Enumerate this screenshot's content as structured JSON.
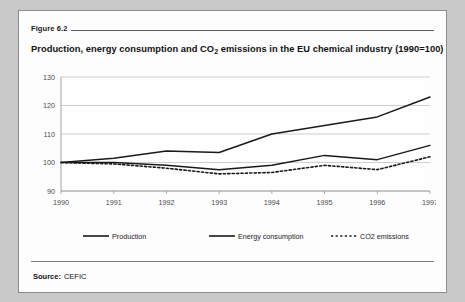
{
  "figure": {
    "label": "Figure 6.2",
    "title_part1": "Production, energy consumption and CO",
    "title_sub": "2",
    "title_part2": " emissions in the EU chemical industry (1990=100)",
    "title_full": "Production, energy consumption and CO2 emissions in the EU chemical industry (1990=100)"
  },
  "source": {
    "label": "Source:",
    "value": "CEFIC"
  },
  "legend": {
    "items": [
      {
        "name": "Production",
        "style": "solid",
        "color": "#1a1a1a"
      },
      {
        "name": "Energy consumption",
        "style": "solid",
        "color": "#1a1a1a"
      },
      {
        "name": "CO2 emissions",
        "style": "dotted",
        "color": "#1a1a1a"
      }
    ]
  },
  "chart_data": {
    "type": "line",
    "title": "Production, energy consumption and CO2 emissions in the EU chemical industry (1990=100)",
    "xlabel": "",
    "ylabel": "",
    "x": [
      "1990",
      "1991",
      "1992",
      "1993",
      "1994",
      "1995",
      "1996",
      "1997"
    ],
    "categories": [
      "1990",
      "1991",
      "1992",
      "1993",
      "1994",
      "1995",
      "1996",
      "1997"
    ],
    "ylim": [
      90,
      130
    ],
    "yticks": [
      90,
      100,
      110,
      120,
      130
    ],
    "grid": true,
    "legend_position": "bottom",
    "index_base": "1990=100",
    "series": [
      {
        "name": "Production",
        "style": "solid",
        "values": [
          100,
          101.5,
          104,
          103.5,
          110,
          113,
          116,
          123
        ]
      },
      {
        "name": "Energy consumption",
        "style": "solid",
        "values": [
          100,
          100,
          99,
          97.5,
          99,
          102.5,
          101,
          106
        ]
      },
      {
        "name": "CO2 emissions",
        "style": "dotted",
        "values": [
          100,
          99.5,
          98,
          96,
          96.5,
          99,
          97.5,
          102
        ]
      }
    ]
  }
}
